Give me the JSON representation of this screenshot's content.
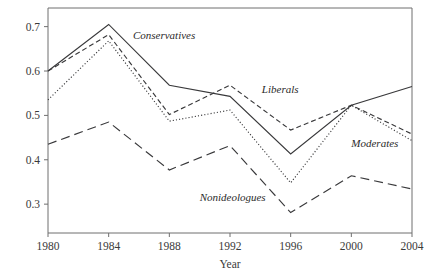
{
  "chart_data": {
    "type": "line",
    "title": "",
    "xlabel": "Year",
    "ylabel": "",
    "x": [
      1980,
      1984,
      1988,
      1992,
      1996,
      2000,
      2004
    ],
    "xticklabels": [
      "1980",
      "1984",
      "1988",
      "1992",
      "1996",
      "2000",
      "2004"
    ],
    "yticklabels": [
      "0.3",
      "0.4",
      "0.5",
      "0.6",
      "0.7"
    ],
    "yticks": [
      0.3,
      0.4,
      0.5,
      0.6,
      0.7
    ],
    "xlim": [
      1980,
      2004
    ],
    "ylim": [
      0.235,
      0.742
    ],
    "grid": false,
    "legend_position": "inline-annotations",
    "series": [
      {
        "name": "Conservatives",
        "linestyle": "solid",
        "color": "#39393b",
        "values": [
          0.6,
          0.705,
          0.568,
          0.543,
          0.413,
          0.523,
          0.565
        ],
        "label_x": 1985.6,
        "label_y": 0.672
      },
      {
        "name": "Liberals",
        "linestyle": "dashed",
        "color": "#39393b",
        "values": [
          0.6,
          0.682,
          0.502,
          0.568,
          0.467,
          0.523,
          0.458
        ],
        "label_x": 1994.1,
        "label_y": 0.55
      },
      {
        "name": "Moderates",
        "linestyle": "dotted",
        "color": "#39393b",
        "values": [
          0.535,
          0.668,
          0.487,
          0.512,
          0.348,
          0.523,
          0.443
        ],
        "label_x": 2000.0,
        "label_y": 0.428
      },
      {
        "name": "Nonideologues",
        "linestyle": "longdash",
        "color": "#39393b",
        "values": [
          0.435,
          0.485,
          0.377,
          0.432,
          0.281,
          0.364,
          0.334
        ],
        "label_x": 1990.0,
        "label_y": 0.308
      }
    ]
  },
  "axes": {
    "frame_color": "#6f6f6f",
    "text_color": "#3a3a3a"
  }
}
